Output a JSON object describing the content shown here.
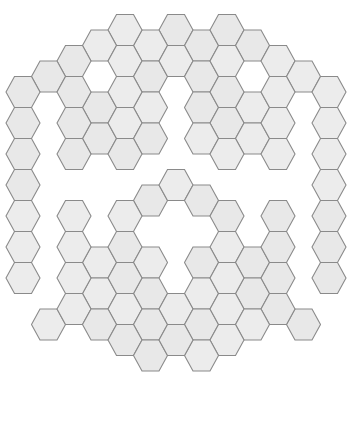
{
  "canvas": {
    "width": 348,
    "height": 446,
    "background": "#ffffff",
    "title": "hexagonal-tile-pattern"
  },
  "style": {
    "hex_fill": "#e8e8e8",
    "hex_fill_alt": "#ececec",
    "hex_stroke": "#8a8a8a",
    "hex_stroke_width": 1.1,
    "orientation": "flat-top"
  },
  "geometry": {
    "hex_width": 34,
    "hex_height": 31,
    "col_pitch": 25.5,
    "row_pitch": 31,
    "origin_x": 23,
    "origin_y": 30,
    "note": "axial flat-top grid; x = origin_x + q*col_pitch, y = origin_y + r*row_pitch + (q odd ? row_pitch/2 : 0)"
  },
  "chart_data": {
    "type": "scatter",
    "xlabel": "",
    "ylabel": "",
    "grid": false,
    "legend": null,
    "cells": [
      [
        6,
        0
      ],
      [
        5,
        0
      ],
      [
        7,
        0
      ],
      [
        4,
        0
      ],
      [
        8,
        0
      ],
      [
        3,
        0
      ],
      [
        9,
        0
      ],
      [
        4,
        1
      ],
      [
        5,
        1
      ],
      [
        6,
        1
      ],
      [
        7,
        1
      ],
      [
        8,
        1
      ],
      [
        2,
        1
      ],
      [
        10,
        1
      ],
      [
        1,
        1
      ],
      [
        11,
        1
      ],
      [
        3,
        2
      ],
      [
        5,
        2
      ],
      [
        7,
        2
      ],
      [
        9,
        2
      ],
      [
        0,
        2
      ],
      [
        12,
        2
      ],
      [
        2,
        2
      ],
      [
        4,
        2
      ],
      [
        8,
        2
      ],
      [
        10,
        2
      ],
      [
        3,
        3
      ],
      [
        4,
        3
      ],
      [
        8,
        3
      ],
      [
        9,
        3
      ],
      [
        0,
        3
      ],
      [
        12,
        3
      ],
      [
        5,
        3
      ],
      [
        7,
        3
      ],
      [
        2,
        3
      ],
      [
        10,
        3
      ],
      [
        0,
        4
      ],
      [
        12,
        4
      ],
      [
        4,
        4
      ],
      [
        8,
        4
      ],
      [
        2,
        4
      ],
      [
        10,
        4
      ],
      [
        0,
        5
      ],
      [
        12,
        5
      ],
      [
        5,
        5
      ],
      [
        6,
        5
      ],
      [
        7,
        5
      ],
      [
        0,
        6
      ],
      [
        12,
        6
      ],
      [
        2,
        6
      ],
      [
        10,
        6
      ],
      [
        4,
        6
      ],
      [
        8,
        6
      ],
      [
        0,
        7
      ],
      [
        12,
        7
      ],
      [
        3,
        7
      ],
      [
        4,
        7
      ],
      [
        8,
        7
      ],
      [
        9,
        7
      ],
      [
        5,
        7
      ],
      [
        7,
        7
      ],
      [
        2,
        7
      ],
      [
        10,
        7
      ],
      [
        0,
        8
      ],
      [
        12,
        8
      ],
      [
        3,
        8
      ],
      [
        5,
        8
      ],
      [
        7,
        8
      ],
      [
        9,
        8
      ],
      [
        2,
        8
      ],
      [
        4,
        8
      ],
      [
        8,
        8
      ],
      [
        10,
        8
      ],
      [
        1,
        9
      ],
      [
        11,
        9
      ],
      [
        2,
        9
      ],
      [
        10,
        9
      ],
      [
        4,
        9
      ],
      [
        5,
        9
      ],
      [
        6,
        9
      ],
      [
        7,
        9
      ],
      [
        8,
        9
      ],
      [
        3,
        9
      ],
      [
        9,
        9
      ],
      [
        4,
        10
      ],
      [
        8,
        10
      ],
      [
        5,
        10
      ],
      [
        7,
        10
      ],
      [
        6,
        10
      ]
    ],
    "cell_count": 90
  }
}
